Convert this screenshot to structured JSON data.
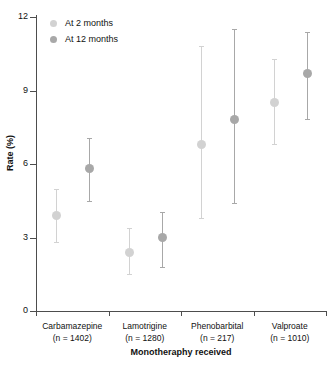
{
  "chart_data": {
    "type": "scatter",
    "title": "",
    "xlabel": "Monotheraphy received",
    "ylabel": "Rate (%)",
    "ylim": [
      0,
      12
    ],
    "yticks": [
      0,
      3,
      6,
      9,
      12
    ],
    "ytick_labels": [
      "0",
      "3",
      "6",
      "9",
      "12"
    ],
    "grid": false,
    "legend_position": "top-left",
    "error_bars": "95% CI (vertical lines with caps)",
    "categories": [
      "Carbamazepine",
      "Lamotrigine",
      "Phenobarbital",
      "Valproate"
    ],
    "category_counts": [
      "(n = 1402)",
      "(n = 1280)",
      "(n = 217)",
      "(n = 1010)"
    ],
    "series": [
      {
        "name": "At 2 months",
        "color": "#d2d2d2",
        "values": [
          3.9,
          2.4,
          6.8,
          8.5
        ],
        "ci_low": [
          2.8,
          1.5,
          3.8,
          6.8
        ],
        "ci_high": [
          5.0,
          3.4,
          10.8,
          10.3
        ]
      },
      {
        "name": "At 12 months",
        "color": "#a8a8a8",
        "values": [
          5.8,
          3.0,
          7.8,
          9.7
        ],
        "ci_low": [
          4.5,
          1.8,
          4.4,
          7.85
        ],
        "ci_high": [
          7.05,
          4.05,
          11.5,
          11.4
        ]
      }
    ]
  },
  "legend": {
    "items": [
      {
        "label": "At 2 months",
        "color": "#d2d2d2"
      },
      {
        "label": "At 12 months",
        "color": "#a8a8a8"
      }
    ]
  },
  "axes": {
    "y_title": "Rate (%)",
    "x_title": "Monotheraphy received"
  }
}
